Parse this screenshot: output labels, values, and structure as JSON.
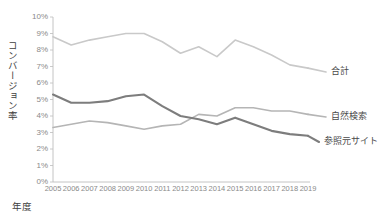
{
  "chart_data": {
    "type": "line",
    "title": "",
    "xlabel": "年度",
    "ylabel": "コンバージョン率",
    "x": [
      2005,
      2006,
      2007,
      2008,
      2009,
      2010,
      2011,
      2012,
      2013,
      2014,
      2015,
      2016,
      2017,
      2018,
      2019
    ],
    "categories": [
      "2005",
      "2006",
      "2007",
      "2008",
      "2009",
      "2010",
      "2011",
      "2012",
      "2013",
      "2014",
      "2015",
      "2016",
      "2017",
      "2018",
      "2019"
    ],
    "xtick_labels": [
      "2005",
      "2006",
      "2007",
      "2008",
      "2009",
      "2010",
      "2011",
      "2012",
      "2013",
      "2014",
      "2015",
      "2016",
      "2017",
      "2018",
      "2019"
    ],
    "ytick_labels": [
      "0%",
      "1%",
      "2%",
      "3%",
      "4%",
      "5%",
      "6%",
      "7%",
      "8%",
      "9%",
      "10%"
    ],
    "ytick_values": [
      0,
      1,
      2,
      3,
      4,
      5,
      6,
      7,
      8,
      9,
      10
    ],
    "ylim": [
      0,
      10
    ],
    "xlim": [
      2005,
      2019
    ],
    "grid": false,
    "legend_position": "right-inline",
    "series": [
      {
        "name": "合計",
        "color": "#c9c9c9",
        "width": 1.6,
        "label_x": 331,
        "label_y": 71,
        "values": [
          8.8,
          8.3,
          8.6,
          8.8,
          9.0,
          9.0,
          8.5,
          7.8,
          8.2,
          7.6,
          8.6,
          8.2,
          7.7,
          7.1,
          6.9
        ]
      },
      {
        "name": "自然検索",
        "color": "#b5b5b5",
        "width": 1.6,
        "label_x": 331,
        "label_y": 116,
        "values": [
          3.3,
          3.5,
          3.7,
          3.6,
          3.4,
          3.2,
          3.4,
          3.5,
          4.1,
          4.0,
          4.5,
          4.5,
          4.3,
          4.3,
          4.1
        ]
      },
      {
        "name": "参照元サイト",
        "color": "#7d7d7d",
        "width": 2.1,
        "label_x": 324,
        "label_y": 141,
        "values": [
          5.3,
          4.8,
          4.8,
          4.9,
          5.2,
          5.3,
          4.6,
          4.0,
          3.8,
          3.5,
          3.9,
          3.5,
          3.1,
          2.9,
          2.8
        ]
      }
    ],
    "axis_color": "#bdbdbd",
    "tick_color": "#8a8a8a",
    "text_color": "#3f3f3f",
    "background": "#ffffff"
  },
  "layout": {
    "plot_left": 53,
    "plot_right": 308,
    "plot_top": 17,
    "plot_bottom": 182
  }
}
